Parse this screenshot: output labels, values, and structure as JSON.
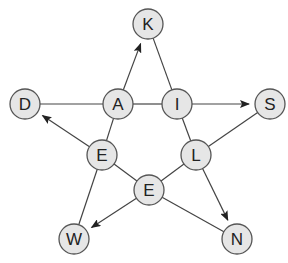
{
  "diagram": {
    "type": "star-letter-graph",
    "colors": {
      "node_fill": "#e6e6e6",
      "node_stroke": "#555555",
      "edge": "#444444",
      "label": "#222222"
    },
    "node_radius": 15,
    "nodes": [
      {
        "id": "K",
        "label": "K",
        "x": 148,
        "y": 24
      },
      {
        "id": "D",
        "label": "D",
        "x": 25,
        "y": 104
      },
      {
        "id": "A",
        "label": "A",
        "x": 118,
        "y": 104
      },
      {
        "id": "I",
        "label": "I",
        "x": 177,
        "y": 104
      },
      {
        "id": "S",
        "label": "S",
        "x": 270,
        "y": 104
      },
      {
        "id": "E1",
        "label": "E",
        "x": 102,
        "y": 155
      },
      {
        "id": "L",
        "label": "L",
        "x": 196,
        "y": 155
      },
      {
        "id": "E2",
        "label": "E",
        "x": 149,
        "y": 190
      },
      {
        "id": "W",
        "label": "W",
        "x": 74,
        "y": 239
      },
      {
        "id": "N",
        "label": "N",
        "x": 237,
        "y": 239
      }
    ],
    "edges": [
      {
        "from": "D",
        "to": "A",
        "arrow": false
      },
      {
        "from": "A",
        "to": "I",
        "arrow": false
      },
      {
        "from": "I",
        "to": "S",
        "arrow": true
      },
      {
        "from": "A",
        "to": "K",
        "arrow": true
      },
      {
        "from": "K",
        "to": "I",
        "arrow": false
      },
      {
        "from": "I",
        "to": "L",
        "arrow": false
      },
      {
        "from": "L",
        "to": "N",
        "arrow": true
      },
      {
        "from": "S",
        "to": "L",
        "arrow": false
      },
      {
        "from": "L",
        "to": "E2",
        "arrow": false
      },
      {
        "from": "E2",
        "to": "W",
        "arrow": true
      },
      {
        "from": "E2",
        "to": "N",
        "arrow": false
      },
      {
        "from": "E1",
        "to": "E2",
        "arrow": false
      },
      {
        "from": "E1",
        "to": "W",
        "arrow": false
      },
      {
        "from": "E1",
        "to": "D",
        "arrow": true
      },
      {
        "from": "A",
        "to": "E1",
        "arrow": false
      }
    ]
  }
}
